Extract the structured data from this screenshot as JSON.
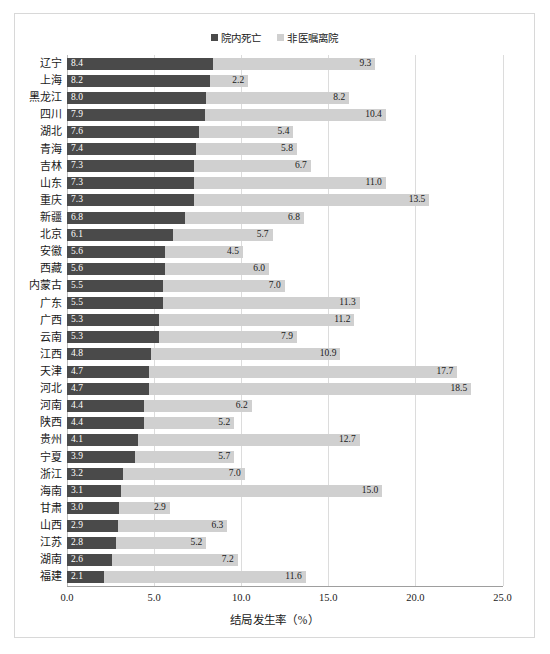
{
  "legend": {
    "position": "top-center",
    "entries": [
      {
        "label": "院内死亡",
        "color": "#4a4a4a",
        "marker": "square-marker-dark"
      },
      {
        "label": "非医嘱离院",
        "color": "#d0d0d0",
        "marker": "square-marker-light"
      }
    ]
  },
  "axis": {
    "x_title": "结局发生率（%）",
    "tick_labels": [
      "0.0",
      "5.0",
      "10.0",
      "15.0",
      "20.0",
      "25.0"
    ],
    "tick_values": [
      0,
      5,
      10,
      15,
      20,
      25
    ]
  },
  "caption_partial": "图 　 　  　 　 　 　 　",
  "chart_data": {
    "type": "bar",
    "orientation": "horizontal",
    "stacked": true,
    "title": "",
    "subtitle": "",
    "xlabel": "结局发生率（%）",
    "ylabel": "",
    "xlim": [
      0,
      25
    ],
    "xticks": [
      0,
      5,
      10,
      15,
      20,
      25
    ],
    "grid": true,
    "legend_position": "top-center",
    "categories": [
      "辽宁",
      "上海",
      "黑龙江",
      "四川",
      "湖北",
      "青海",
      "吉林",
      "山东",
      "重庆",
      "新疆",
      "北京",
      "安徽",
      "西藏",
      "内蒙古",
      "广东",
      "广西",
      "云南",
      "江西",
      "天津",
      "河北",
      "河南",
      "陕西",
      "贵州",
      "宁夏",
      "浙江",
      "海南",
      "甘肃",
      "山西",
      "江苏",
      "湖南",
      "福建"
    ],
    "series": [
      {
        "name": "院内死亡",
        "color": "#4a4a4a",
        "values": [
          8.4,
          8.2,
          8.0,
          7.9,
          7.6,
          7.4,
          7.3,
          7.3,
          7.3,
          6.8,
          6.1,
          5.6,
          5.6,
          5.5,
          5.5,
          5.3,
          5.3,
          4.8,
          4.7,
          4.7,
          4.4,
          4.4,
          4.1,
          3.9,
          3.2,
          3.1,
          3.0,
          2.9,
          2.8,
          2.6,
          2.1
        ]
      },
      {
        "name": "非医嘱离院",
        "color": "#d0d0d0",
        "values": [
          9.3,
          2.2,
          8.2,
          10.4,
          5.4,
          5.8,
          6.7,
          11.0,
          13.5,
          6.8,
          5.7,
          4.5,
          6.0,
          7.0,
          11.3,
          11.2,
          7.9,
          10.9,
          17.7,
          18.5,
          6.2,
          5.2,
          12.7,
          5.7,
          7.0,
          15.0,
          2.9,
          6.3,
          5.2,
          7.2,
          11.6
        ]
      }
    ]
  }
}
